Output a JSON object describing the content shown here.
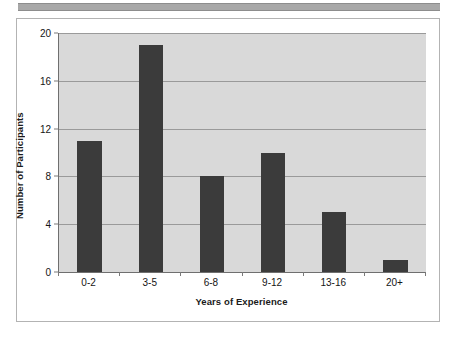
{
  "figure": {
    "background_color": "#ffffff",
    "frame_color": "#b3b3b3",
    "top_rule_color": "#a8a8a8"
  },
  "chart_data": {
    "type": "bar",
    "title": "",
    "subtitle": "",
    "categories": [
      "0-2",
      "3-5",
      "6-8",
      "9-12",
      "13-16",
      "20+"
    ],
    "values": [
      11,
      19,
      8,
      10,
      5,
      1
    ],
    "series": [
      {
        "name": "Number of Participants",
        "values": [
          11,
          19,
          8,
          10,
          5,
          1
        ]
      }
    ],
    "xlabel": "Years of Experience",
    "ylabel": "Number of Participants",
    "ylim": [
      0,
      20
    ],
    "yticks": [
      0,
      4,
      8,
      12,
      16,
      20
    ],
    "ytick_labels": [
      "0",
      "4",
      "8",
      "12",
      "16",
      "20"
    ],
    "grid": true,
    "grid_axis": "y",
    "legend": false,
    "legend_position": "none",
    "bar_color": "#3b3b3b",
    "plot_background_color": "#d9d9d9",
    "gridline_color": "#9a9a9a",
    "axis_color": "#6f6f6f",
    "annotations": []
  }
}
